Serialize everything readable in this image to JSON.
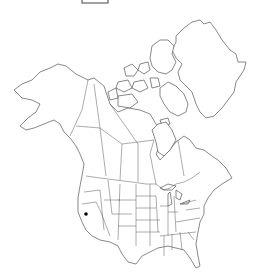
{
  "map": {
    "title": "",
    "region": "North America",
    "background_color": "#ffffff",
    "line_color": "#555555",
    "marker_color": "#000000",
    "occurrences": [
      {
        "label": "California",
        "x": 86,
        "y": 214
      }
    ],
    "legend_box": {
      "x": 82,
      "y": 0,
      "width": 26,
      "height": 4
    }
  }
}
